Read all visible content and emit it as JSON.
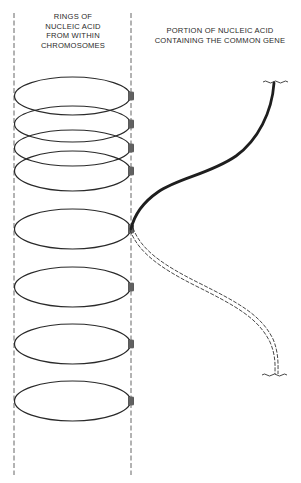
{
  "diagram": {
    "labels": {
      "rings": "RINGS OF\nNUCLEIC ACID\nFROM WITHIN\nCHROMOSOMES",
      "gene_portion": "PORTION OF NUCLEIC ACID\nCONTAINING THE COMMON GENE"
    },
    "colors": {
      "ink": "#2a2a2a",
      "dashed_guide": "#555555",
      "background": "#ffffff"
    },
    "rings": {
      "count": 8,
      "center_x": 72,
      "radius_x": 58,
      "centers_y": [
        96,
        124,
        148,
        170,
        229,
        287,
        344,
        401
      ],
      "radius_y": [
        19,
        19,
        19,
        20,
        20,
        20,
        20,
        20
      ]
    },
    "guide_lines": {
      "left_x": 14,
      "right_x": 131,
      "top_y": 13,
      "bottom_y": 475
    },
    "gene_strand": {
      "solid_segment": "top end at wavy break (274,82) to ring attachment (131,229)",
      "double_dashed_segment": "ring attachment (131,229) to wavy break (276,374)"
    }
  }
}
